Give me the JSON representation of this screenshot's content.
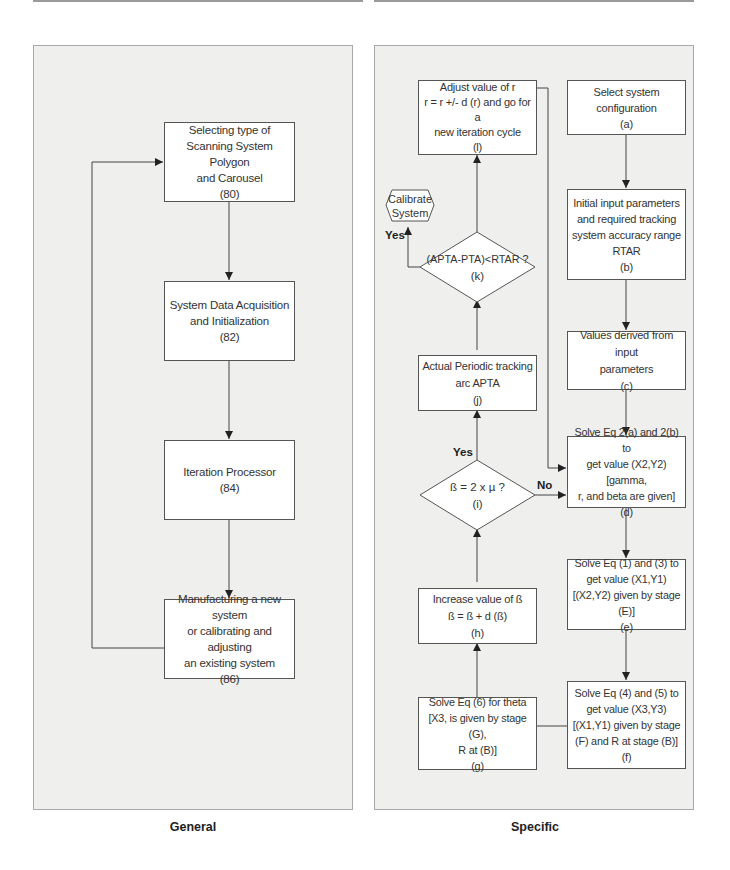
{
  "general": {
    "caption": "General",
    "boxes": [
      {
        "lines": [
          "Selecting type of",
          "Scanning System Polygon",
          "and Carousel",
          "(80)"
        ]
      },
      {
        "lines": [
          "System Data Acquisition",
          "and Initialization",
          "(82)"
        ]
      },
      {
        "lines": [
          "Iteration Processor",
          "(84)"
        ]
      },
      {
        "lines": [
          "Manufacturing a new system",
          "or calibrating and adjusting",
          "an existing system",
          "(86)"
        ]
      }
    ]
  },
  "specific": {
    "caption": "Specific",
    "steps": {
      "a": {
        "lines": [
          "Select system",
          "configuration",
          "(a)"
        ]
      },
      "b": {
        "lines": [
          "Initial input parameters",
          "and required tracking",
          "system accuracy range",
          "RTAR",
          "(b)"
        ]
      },
      "c": {
        "lines": [
          "Values derived from input",
          "parameters",
          "(c)"
        ]
      },
      "d": {
        "lines": [
          "Solve Eq 2(a) and 2(b) to",
          "get value (X2,Y2) [gamma,",
          "r, and beta are given]",
          "(d)"
        ]
      },
      "e": {
        "lines": [
          "Solve Eq (1) and (3) to",
          "get value (X1,Y1)",
          "[(X2,Y2) given by stage (E)]",
          "(e)"
        ]
      },
      "f": {
        "lines": [
          "Solve Eq (4) and (5) to",
          "get value (X3,Y3)",
          "[(X1,Y1) given by stage",
          "(F) and R at stage (B)]",
          "(f)"
        ]
      },
      "g": {
        "lines": [
          "Solve Eq (6) for theta",
          "[X3, is given by stage (G),",
          "R at (B)]",
          "(g)"
        ]
      },
      "h": {
        "lines": [
          "Increase value of ß",
          "ß = ß + d (ß)",
          "(h)"
        ]
      },
      "i": {
        "lines": [
          "ß = 2 x µ ?",
          "(i)"
        ]
      },
      "j": {
        "lines": [
          "Actual Periodic tracking",
          "arc  APTA",
          "(j)"
        ]
      },
      "k": {
        "lines": [
          "(APTA-PTA)<RTAR ?",
          "(k)"
        ]
      },
      "l": {
        "lines": [
          "Adjust value of r",
          "r = r +/- d (r) and go for a",
          "new iteration cycle",
          "(l)"
        ]
      }
    },
    "terminal": {
      "lines": [
        "Calibrate",
        "System"
      ]
    },
    "labels": {
      "yes_k": "Yes",
      "yes_i": "Yes",
      "no_i": "No"
    }
  },
  "colors": {
    "panel_bg": "#efefed",
    "box_bg": "#ffffff",
    "line": "#444444"
  }
}
